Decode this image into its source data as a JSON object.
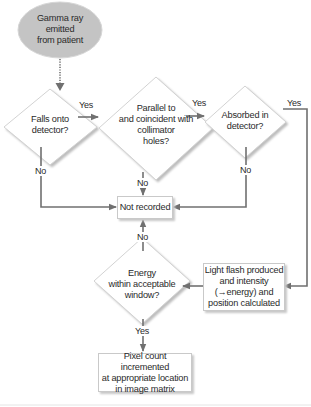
{
  "diagram": {
    "colors": {
      "start_fill": "#c4c4c4",
      "node_border": "#c9c9c9",
      "shadow": "#c8c8c8",
      "arrow": "#707070",
      "text": "#2a2a2a"
    },
    "nodes": {
      "start": {
        "type": "ellipse",
        "label": "Gamma ray emitted from patient",
        "lines": [
          "Gamma ray",
          "emitted",
          "from patient"
        ]
      },
      "falls_onto_detector": {
        "type": "decision",
        "label": "Falls onto detector?",
        "lines": [
          "Falls onto",
          "detector?"
        ]
      },
      "parallel_collimator": {
        "type": "decision",
        "label": "Parallel to and coincident with collimator holes?",
        "lines": [
          "Parallel to",
          "and coincident with",
          "collimator",
          "holes?"
        ]
      },
      "absorbed_detector": {
        "type": "decision",
        "label": "Absorbed in detector?",
        "lines": [
          "Absorbed in",
          "detector?"
        ]
      },
      "not_recorded": {
        "type": "process",
        "label": "Not recorded"
      },
      "light_flash": {
        "type": "process",
        "label": "Light flash produced and intensity (→energy) and position calculated",
        "lines": [
          "Light flash produced",
          "and intensity",
          "(→energy) and",
          "position calculated"
        ]
      },
      "energy_window": {
        "type": "decision",
        "label": "Energy within acceptable window?",
        "lines": [
          "Energy",
          "within acceptable",
          "window?"
        ]
      },
      "pixel_count": {
        "type": "process",
        "label": "Pixel count incremented at appropriate location in image matrix",
        "lines": [
          "Pixel count incremented",
          "at appropriate location",
          "in image matrix"
        ]
      }
    },
    "edges": [
      {
        "from": "start",
        "to": "falls_onto_detector",
        "label": "",
        "style": "dotted"
      },
      {
        "from": "falls_onto_detector",
        "to": "parallel_collimator",
        "label": "Yes"
      },
      {
        "from": "falls_onto_detector",
        "to": "not_recorded",
        "label": "No"
      },
      {
        "from": "parallel_collimator",
        "to": "absorbed_detector",
        "label": "Yes"
      },
      {
        "from": "parallel_collimator",
        "to": "not_recorded",
        "label": "No"
      },
      {
        "from": "absorbed_detector",
        "to": "light_flash",
        "label": "Yes"
      },
      {
        "from": "absorbed_detector",
        "to": "not_recorded",
        "label": "No"
      },
      {
        "from": "light_flash",
        "to": "energy_window",
        "label": ""
      },
      {
        "from": "energy_window",
        "to": "not_recorded",
        "label": "No"
      },
      {
        "from": "energy_window",
        "to": "pixel_count",
        "label": "Yes"
      }
    ]
  }
}
